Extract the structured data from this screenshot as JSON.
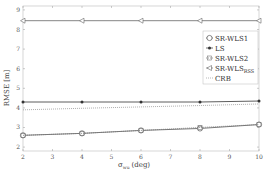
{
  "chart_data": {
    "type": "line",
    "title": "",
    "xlabel": "σ_wu (deg)",
    "xlabel_main": "σ",
    "xlabel_sub": "wu",
    "xlabel_unit": "(deg)",
    "ylabel": "RMSE [m]",
    "x": [
      2,
      4,
      6,
      8,
      10
    ],
    "xlim": [
      2,
      10
    ],
    "ylim": [
      1.8,
      9.2
    ],
    "xticks": [
      2,
      3,
      4,
      5,
      6,
      7,
      8,
      9,
      10
    ],
    "yticks": [
      2,
      3,
      4,
      5,
      6,
      7,
      8,
      9
    ],
    "grid": false,
    "legend_position": "right-upper",
    "series": [
      {
        "name": "SR-WLS1",
        "marker": "circle-open",
        "line": "solid",
        "color": "#555555",
        "values": [
          2.6,
          2.7,
          2.85,
          2.95,
          3.15
        ]
      },
      {
        "name": "LS",
        "marker": "dot-filled",
        "line": "solid",
        "color": "#333333",
        "values": [
          4.3,
          4.3,
          4.3,
          4.3,
          4.35
        ]
      },
      {
        "name": "SR-WLS2",
        "marker": "diamond-open",
        "line": "dotted",
        "color": "#777777",
        "values": [
          2.6,
          2.7,
          2.85,
          3.0,
          3.15
        ]
      },
      {
        "name": "SR-WLS_RSS",
        "marker": "triangle-left-open",
        "line": "solid",
        "color": "#666666",
        "values": [
          8.45,
          8.45,
          8.45,
          8.45,
          8.45
        ]
      },
      {
        "name": "CRB",
        "marker": "none",
        "line": "dotted",
        "color": "#999999",
        "values": [
          3.9,
          3.98,
          4.05,
          4.12,
          4.2
        ]
      }
    ]
  },
  "legend": {
    "items": [
      {
        "label": "SR-WLS1",
        "sub": ""
      },
      {
        "label": "LS",
        "sub": ""
      },
      {
        "label": "SR-WLS2",
        "sub": ""
      },
      {
        "label": "SR-WLS",
        "sub": "RSS"
      },
      {
        "label": "CRB",
        "sub": ""
      }
    ]
  },
  "axes": {
    "ylabel": "RMSE [m]",
    "xlabel_main": "σ",
    "xlabel_sub": "wu",
    "xlabel_unit": "(deg)"
  }
}
